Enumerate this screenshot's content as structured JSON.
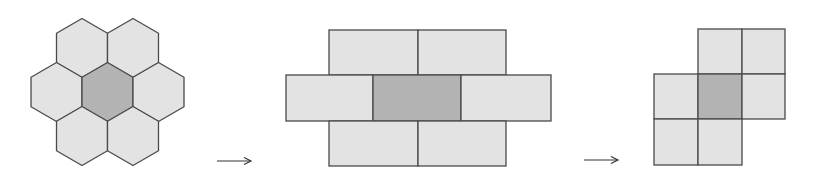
{
  "colors": {
    "light_fill": "#e3e3e3",
    "dark_fill": "#b3b3b3",
    "stroke": "#4a4a4a",
    "arrow": "#333333"
  },
  "figures": [
    {
      "name": "hexagon-cluster",
      "cells": 7,
      "highlighted": "center"
    },
    {
      "name": "brick-layout",
      "cells": 7,
      "highlighted": "center"
    },
    {
      "name": "square-grid-layout",
      "cells": 7,
      "highlighted": "center"
    }
  ],
  "arrows": [
    {
      "from": "hexagon-cluster",
      "to": "brick-layout"
    },
    {
      "from": "brick-layout",
      "to": "square-grid-layout"
    }
  ]
}
